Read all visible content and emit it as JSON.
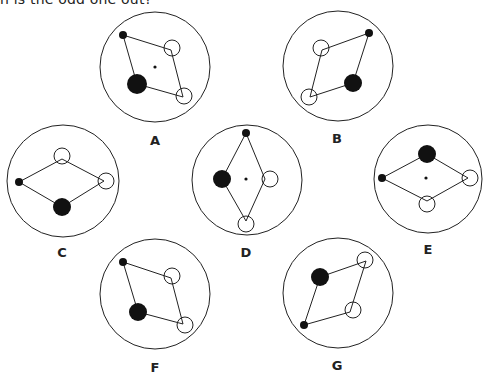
{
  "question": "h is the odd one out?",
  "colors": {
    "stroke": "#222222",
    "fill_dark": "#111111",
    "background": "#ffffff"
  },
  "options": [
    {
      "label": "A",
      "outer": [
        155,
        67,
        55
      ],
      "label_pos": [
        155,
        145
      ],
      "center_dot": [
        155,
        67
      ],
      "polygon": [
        [
          123,
          35
        ],
        [
          171,
          50
        ],
        [
          183,
          97
        ],
        [
          137,
          84
        ]
      ],
      "small_black": [
        123,
        35,
        4
      ],
      "big_black": [
        137,
        84,
        10
      ],
      "open": [
        [
          172,
          48,
          8
        ],
        [
          184,
          96,
          8
        ]
      ]
    },
    {
      "label": "B",
      "outer": [
        338,
        66,
        55
      ],
      "label_pos": [
        337,
        143
      ],
      "center_dot": null,
      "polygon": [
        [
          369,
          33
        ],
        [
          322,
          50
        ],
        [
          310,
          97
        ],
        [
          353,
          83
        ]
      ],
      "small_black": [
        369,
        33,
        4
      ],
      "big_black": [
        353,
        83,
        9
      ],
      "open": [
        [
          321,
          48,
          8
        ],
        [
          309,
          97,
          8
        ]
      ]
    },
    {
      "label": "C",
      "outer": [
        63,
        181,
        56
      ],
      "label_pos": [
        62,
        257
      ],
      "center_dot": null,
      "polygon": [
        [
          19,
          182
        ],
        [
          62,
          159
        ],
        [
          104,
          181
        ],
        [
          62,
          207
        ]
      ],
      "small_black": [
        19,
        182,
        4
      ],
      "big_black": [
        62,
        207,
        9
      ],
      "open": [
        [
          62,
          156,
          8
        ],
        [
          106,
          181,
          8
        ]
      ]
    },
    {
      "label": "D",
      "outer": [
        247,
        180,
        55
      ],
      "label_pos": [
        246,
        257
      ],
      "center_dot": [
        246,
        179
      ],
      "polygon": [
        [
          246,
          133
        ],
        [
          265,
          179
        ],
        [
          246,
          221
        ],
        [
          222,
          179
        ]
      ],
      "small_black": [
        246,
        133,
        4
      ],
      "big_black": [
        222,
        179,
        9
      ],
      "open": [
        [
          270,
          179,
          8
        ],
        [
          246,
          224,
          8
        ]
      ]
    },
    {
      "label": "E",
      "outer": [
        428,
        179,
        54
      ],
      "label_pos": [
        428,
        254
      ],
      "center_dot": [
        426,
        178
      ],
      "polygon": [
        [
          382,
          178
        ],
        [
          427,
          154
        ],
        [
          468,
          178
        ],
        [
          427,
          201
        ]
      ],
      "small_black": [
        382,
        178,
        4
      ],
      "big_black": [
        427,
        154,
        9
      ],
      "open": [
        [
          470,
          178,
          8
        ],
        [
          427,
          204,
          8
        ]
      ]
    },
    {
      "label": "F",
      "outer": [
        155,
        294,
        55
      ],
      "label_pos": [
        155,
        372
      ],
      "center_dot": null,
      "polygon": [
        [
          123,
          262
        ],
        [
          171,
          278
        ],
        [
          183,
          324
        ],
        [
          138,
          312
        ]
      ],
      "small_black": [
        123,
        262,
        4
      ],
      "big_black": [
        138,
        312,
        9
      ],
      "open": [
        [
          172,
          276,
          8
        ],
        [
          185,
          325,
          8
        ]
      ]
    },
    {
      "label": "G",
      "outer": [
        338,
        293,
        55
      ],
      "label_pos": [
        337,
        370
      ],
      "center_dot": null,
      "polygon": [
        [
          320,
          277
        ],
        [
          366,
          261
        ],
        [
          350,
          312
        ],
        [
          304,
          325
        ]
      ],
      "small_black": [
        304,
        325,
        4
      ],
      "big_black": [
        320,
        277,
        9
      ],
      "open": [
        [
          365,
          260,
          8
        ],
        [
          353,
          310,
          8
        ]
      ]
    }
  ]
}
